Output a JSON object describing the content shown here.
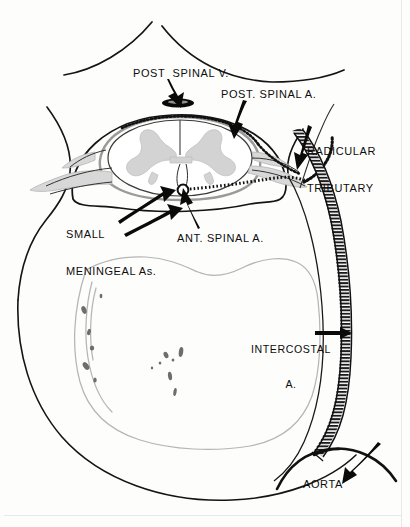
{
  "figure": {
    "domain": "anatomical line diagram",
    "background_color": "#fdfdfc",
    "ink_color": "#111111",
    "gray_matter_color": "#d2d2d2",
    "membrane_color": "#cfcfcf"
  },
  "labels": {
    "post_spinal_v": "POST  SPINAL V.",
    "post_spinal_a": "POST. SPINAL A.",
    "radicular_tributary_line1": "RADICULAR",
    "radicular_tributary_line2": "TRIBUTARY",
    "small_meningeal_line1": "SMALL",
    "small_meningeal_line2": "MENINGEAL As.",
    "ant_spinal_a": "ANT. SPINAL A.",
    "intercostal_line1": "INTERCOSTAL",
    "intercostal_line2": "A.",
    "aorta": "AORTA"
  },
  "structures": [
    {
      "name": "spinous-process",
      "description": "two curved lines meeting at top center forming the spinous process"
    },
    {
      "name": "vertebral-arch",
      "description": "large oval outline of the spinal canal / vertebral arch"
    },
    {
      "name": "dura-mater",
      "description": "inner oval membrane surrounding the cord"
    },
    {
      "name": "spinal-cord",
      "description": "oval cord section with butterfly-shaped gray matter"
    },
    {
      "name": "gray-matter",
      "description": "light gray butterfly / H-shaped central gray matter"
    },
    {
      "name": "posterior-spinal-vein",
      "description": "solid black flattened oval at posterior midline"
    },
    {
      "name": "anterior-spinal-artery",
      "description": "small open circle at anterior median fissure"
    },
    {
      "name": "nerve-root-sleeve",
      "description": "gray root sleeves exiting left and right"
    },
    {
      "name": "vertebral-body",
      "description": "large stippled kidney-shaped vertebral body below"
    },
    {
      "name": "intercostal-artery",
      "description": "hatched tubular vessel descending on the right"
    },
    {
      "name": "aorta",
      "description": "large curved vessel at bottom right"
    }
  ]
}
